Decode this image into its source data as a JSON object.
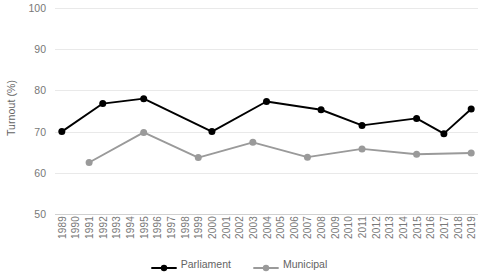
{
  "chart_data": {
    "type": "line",
    "title": "",
    "xlabel": "",
    "ylabel": "Turnout (%)",
    "ylim": [
      50,
      100
    ],
    "yticks": [
      50,
      60,
      70,
      80,
      90,
      100
    ],
    "ytick_labels": [
      "50",
      "60",
      "70",
      "80",
      "90",
      "100"
    ],
    "grid": "horizontal",
    "legend_position": "bottom-center",
    "categories": [
      "1989",
      "1990",
      "1991",
      "1992",
      "1993",
      "1994",
      "1995",
      "1996",
      "1997",
      "1998",
      "1999",
      "2000",
      "2001",
      "2002",
      "2003",
      "2004",
      "2005",
      "2006",
      "2007",
      "2008",
      "2009",
      "2010",
      "2011",
      "2012",
      "2013",
      "2014",
      "2015",
      "2016",
      "2017",
      "2018",
      "2019"
    ],
    "series": [
      {
        "name": "Parliament",
        "color": "#000000",
        "points": [
          {
            "x": "1989",
            "y": 70.0
          },
          {
            "x": "1992",
            "y": 76.8
          },
          {
            "x": "1995",
            "y": 78.0
          },
          {
            "x": "2000",
            "y": 70.0
          },
          {
            "x": "2004",
            "y": 77.3
          },
          {
            "x": "2008",
            "y": 75.3
          },
          {
            "x": "2011",
            "y": 71.5
          },
          {
            "x": "2015",
            "y": 73.2
          },
          {
            "x": "2017",
            "y": 69.5
          },
          {
            "x": "2019",
            "y": 75.5
          }
        ]
      },
      {
        "name": "Municipal",
        "color": "#9a9a9a",
        "points": [
          {
            "x": "1991",
            "y": 62.5
          },
          {
            "x": "1995",
            "y": 69.8
          },
          {
            "x": "1999",
            "y": 63.7
          },
          {
            "x": "2003",
            "y": 67.4
          },
          {
            "x": "2007",
            "y": 63.8
          },
          {
            "x": "2011",
            "y": 65.8
          },
          {
            "x": "2015",
            "y": 64.5
          },
          {
            "x": "2019",
            "y": 64.8
          }
        ]
      }
    ],
    "legend": [
      {
        "label": "Parliament",
        "color": "#000000"
      },
      {
        "label": "Municipal",
        "color": "#9a9a9a"
      }
    ],
    "colors": {
      "gridline": "#e9e9e9",
      "tick_text": "#787878",
      "axis_title": "#636363",
      "background": "#ffffff"
    }
  }
}
